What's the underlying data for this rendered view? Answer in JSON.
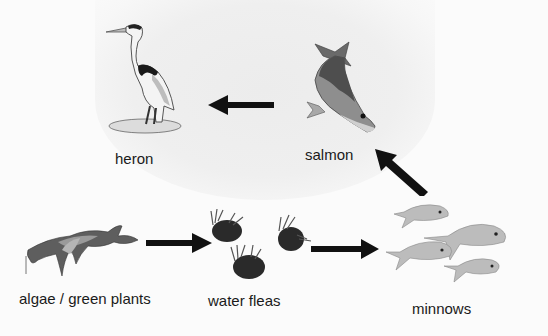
{
  "diagram": {
    "type": "food-chain",
    "nodes": [
      {
        "id": "algae",
        "label": "algae / green plants",
        "icon": "algae-icon"
      },
      {
        "id": "water_fleas",
        "label": "water fleas",
        "icon": "water-flea-icon"
      },
      {
        "id": "minnows",
        "label": "minnows",
        "icon": "minnow-icon"
      },
      {
        "id": "salmon",
        "label": "salmon",
        "icon": "salmon-icon"
      },
      {
        "id": "heron",
        "label": "heron",
        "icon": "heron-icon"
      }
    ],
    "edges": [
      {
        "from": "algae",
        "to": "water_fleas"
      },
      {
        "from": "water_fleas",
        "to": "minnows"
      },
      {
        "from": "minnows",
        "to": "salmon"
      },
      {
        "from": "salmon",
        "to": "heron"
      }
    ],
    "colors": {
      "arrow": "#111111",
      "label": "#1a1a1a",
      "background": "#fbfbfb"
    }
  }
}
